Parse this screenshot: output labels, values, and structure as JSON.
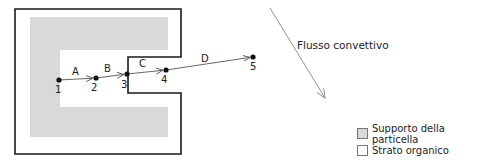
{
  "diagram": {
    "colors": {
      "support": "#d9d9d9",
      "outline": "#1a1a1a",
      "path": "#555555",
      "flow_arrow": "#888888"
    },
    "points": [
      {
        "id": "1",
        "label": "1",
        "x": 59,
        "y": 80
      },
      {
        "id": "2",
        "label": "2",
        "x": 96,
        "y": 78
      },
      {
        "id": "3",
        "label": "3",
        "x": 127,
        "y": 74
      },
      {
        "id": "4",
        "label": "4",
        "x": 166,
        "y": 70
      },
      {
        "id": "5",
        "label": "5",
        "x": 253,
        "y": 57
      }
    ],
    "segments": [
      {
        "label": "A",
        "from": "1",
        "to": "2"
      },
      {
        "label": "B",
        "from": "2",
        "to": "3"
      },
      {
        "label": "C",
        "from": "3",
        "to": "4"
      },
      {
        "label": "D",
        "from": "4",
        "to": "5"
      }
    ],
    "flow": {
      "label": "Flusso convettivo"
    }
  },
  "legend": {
    "items": [
      {
        "label": "Supporto della particella",
        "swatch": "#d9d9d9"
      },
      {
        "label": "Strato organico",
        "swatch": "#ffffff"
      }
    ]
  }
}
